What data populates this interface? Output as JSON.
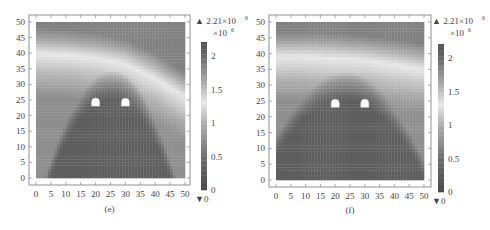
{
  "chart_data": [
    {
      "type": "heatmap",
      "panel_label": "(e)",
      "xlabel": "",
      "ylabel": "",
      "xlim": [
        0,
        50
      ],
      "ylim": [
        0,
        50
      ],
      "x_ticks": [
        "0",
        "5",
        "10",
        "15",
        "20",
        "25",
        "30",
        "35",
        "40",
        "45",
        "50"
      ],
      "y_ticks": [
        "0",
        "5",
        "10",
        "15",
        "20",
        "25",
        "30",
        "35",
        "40",
        "45",
        "50"
      ],
      "colorbar": {
        "max_marker": "▲ 2.21×10",
        "max_exponent": "6",
        "min_marker": "▼0",
        "scale_label": "×10",
        "scale_exponent": "6",
        "ticks": [
          "0",
          "0.5",
          "1",
          "1.5",
          "2"
        ],
        "range": [
          0,
          2.21
        ],
        "colormap": "grayscale-diverging (dark at 0 and 2.21, light near 1.3)"
      },
      "field": {
        "description": "Stress field around two tunnels; low-value dome above tunnels, bright band along a curved ridge",
        "ridge_y_at_x": [
          [
            0,
            40
          ],
          [
            10,
            39.5
          ],
          [
            20,
            38.5
          ],
          [
            30,
            36.5
          ],
          [
            40,
            32
          ],
          [
            50,
            26
          ]
        ],
        "dome": {
          "center_x": 25,
          "top_y": 31,
          "half_width_at_base": 22
        },
        "tunnels": [
          {
            "x": 20,
            "y": 24
          },
          {
            "x": 30,
            "y": 24
          }
        ]
      }
    },
    {
      "type": "heatmap",
      "panel_label": "(f)",
      "xlabel": "",
      "ylabel": "",
      "xlim": [
        0,
        50
      ],
      "ylim": [
        0,
        50
      ],
      "x_ticks": [
        "0",
        "5",
        "10",
        "15",
        "20",
        "25",
        "30",
        "35",
        "40",
        "45",
        "50"
      ],
      "y_ticks": [
        "0",
        "5",
        "10",
        "15",
        "20",
        "25",
        "30",
        "35",
        "40",
        "45",
        "50"
      ],
      "colorbar": {
        "max_marker": "▲ 2.21×10",
        "max_exponent": "6",
        "min_marker": "▼0",
        "scale_label": "×10",
        "scale_exponent": "6",
        "ticks": [
          "0",
          "0.5",
          "1",
          "1.5",
          "2"
        ],
        "range": [
          0,
          2.21
        ],
        "colormap": "grayscale-diverging (dark at 0 and 2.21, light near 1.3)"
      },
      "field": {
        "description": "Stress field around two tunnels; broad low-value zone below, bright band near y=38",
        "ridge_y_at_x": [
          [
            0,
            39
          ],
          [
            10,
            39
          ],
          [
            20,
            38.5
          ],
          [
            30,
            38
          ],
          [
            40,
            36.5
          ],
          [
            50,
            35
          ]
        ],
        "dome": {
          "center_x": 23,
          "top_y": 31,
          "half_width_at_base": 30
        },
        "tunnels": [
          {
            "x": 20,
            "y": 24
          },
          {
            "x": 30,
            "y": 24
          }
        ]
      }
    }
  ]
}
